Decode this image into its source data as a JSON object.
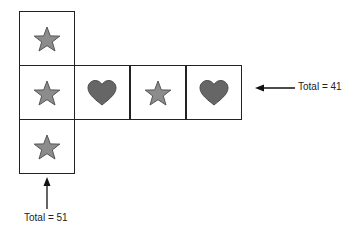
{
  "diagram": {
    "cells": [
      {
        "row": 0,
        "col": 0,
        "shape": "star"
      },
      {
        "row": 1,
        "col": 0,
        "shape": "star"
      },
      {
        "row": 1,
        "col": 1,
        "shape": "heart"
      },
      {
        "row": 1,
        "col": 2,
        "shape": "star"
      },
      {
        "row": 1,
        "col": 3,
        "shape": "heart"
      },
      {
        "row": 2,
        "col": 0,
        "shape": "star"
      }
    ],
    "row_total": {
      "label": "Total = 41",
      "points_to": "row 2"
    },
    "column_total": {
      "label": "Total = 51",
      "points_to": "column 1"
    },
    "colors": {
      "star_fill": "#8c8c8c",
      "star_stroke": "#555555",
      "heart_fill": "#666666",
      "heart_stroke": "#4a4a4a",
      "border": "#222222"
    }
  }
}
